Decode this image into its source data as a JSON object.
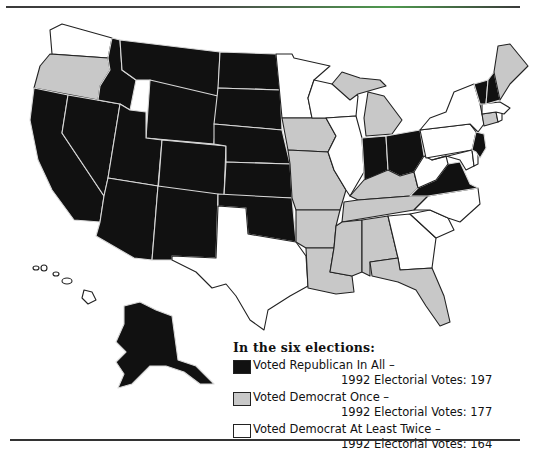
{
  "colors": {
    "republican_all": "#111111",
    "democrat_once": "#c8c8c8",
    "democrat_twice": "#ffffff"
  },
  "legend": {
    "title": "In the six elections:",
    "items": [
      {
        "key": "rep",
        "label": "Voted Republican In All –",
        "sub": "1992 Electorial Votes: 197"
      },
      {
        "key": "dem1",
        "label": "Voted Democrat Once –",
        "sub": "1992 Electorial Votes: 177"
      },
      {
        "key": "dem2",
        "label": "Voted Democrat At Least Twice –",
        "sub": "1992 Electorial Votes: 164"
      }
    ]
  },
  "states": {
    "rep": [
      "MT",
      "ID",
      "WY",
      "ND",
      "SD",
      "NE",
      "KS",
      "OK",
      "CO",
      "UT",
      "NV",
      "CA",
      "AZ",
      "NM",
      "AK",
      "IN",
      "OH",
      "VA",
      "VT",
      "NH",
      "NJ"
    ],
    "dem1": [
      "OR",
      "IA",
      "MO",
      "AR",
      "LA",
      "MS",
      "AL",
      "TN",
      "KY",
      "FL",
      "MI",
      "ME",
      "CT"
    ],
    "dem2": [
      "WA",
      "MN",
      "WI",
      "IL",
      "TX",
      "GA",
      "SC",
      "NC",
      "WV",
      "PA",
      "NY",
      "MA",
      "RI",
      "MD",
      "DE",
      "HI"
    ]
  }
}
